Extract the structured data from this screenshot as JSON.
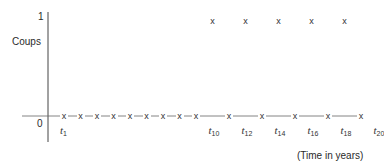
{
  "chart_data": {
    "type": "scatter",
    "title": "",
    "ylabel": "Coups",
    "xlabel": "(Time in years)",
    "yticks": [
      "0",
      "1"
    ],
    "ylim": [
      0,
      1
    ],
    "marker": "x",
    "x_labels": [
      "t1",
      "t10",
      "t12",
      "t14",
      "t16",
      "t18",
      "t20"
    ],
    "x": [
      1,
      2,
      3,
      4,
      5,
      6,
      7,
      8,
      9,
      10,
      11,
      12,
      13,
      14,
      15,
      16,
      17,
      18,
      19
    ],
    "values": [
      0,
      0,
      0,
      0,
      0,
      0,
      0,
      0,
      0,
      1,
      0,
      1,
      0,
      1,
      0,
      1,
      0,
      1,
      0
    ],
    "grid": false,
    "legend": null
  },
  "axis": {
    "ylabel": "Coups",
    "xlabel": "(Time in years)",
    "ytick_top": "1",
    "ytick_zero": "0"
  },
  "labels": [
    {
      "base": "t",
      "sub": "1"
    },
    {
      "base": "t",
      "sub": "10"
    },
    {
      "base": "t",
      "sub": "12"
    },
    {
      "base": "t",
      "sub": "14"
    },
    {
      "base": "t",
      "sub": "16"
    },
    {
      "base": "t",
      "sub": "18"
    },
    {
      "base": "t",
      "sub": "20"
    }
  ],
  "marker_glyph": "x"
}
